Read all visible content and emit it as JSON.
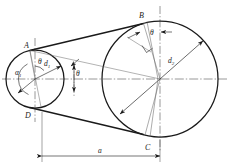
{
  "figure": {
    "type": "engineering-line-drawing",
    "background_color": "#ffffff",
    "line_color": "#1a1a1a",
    "thin_line_color": "#555555"
  },
  "labels": {
    "point_a": "A",
    "point_b": "B",
    "point_c": "C",
    "point_d": "D",
    "small_pulley_diameter": "d",
    "small_pulley_diameter_sub": "1",
    "large_pulley_diameter": "d",
    "large_pulley_diameter_sub": "2",
    "wrap_angle_small": "α",
    "wrap_angle_small_sub": "1",
    "theta_small_pulley": "θ",
    "theta_mid_span": "θ",
    "theta_large_pulley": "θ",
    "center_distance": "a"
  },
  "geometry": {
    "small_pulley": {
      "cx": 35,
      "cy": 79,
      "r": 29
    },
    "large_pulley": {
      "cx": 160,
      "cy": 79,
      "r": 58
    },
    "tangent_top": {
      "x1": 30,
      "y1": 50,
      "x2": 143,
      "y2": 23
    },
    "tangent_bottom": {
      "x1": 30,
      "y1": 108,
      "x2": 143,
      "y2": 135
    },
    "dimension_line_y": 156,
    "dimension_from_x": 42,
    "dimension_to_x": 160
  },
  "annotations": {
    "axis_style": "dash-dot centerline",
    "dimension_label": "a",
    "arrowheads": "filled triangles on radius and angle leaders",
    "right_angle_marker_at": "B-perpendicular"
  }
}
